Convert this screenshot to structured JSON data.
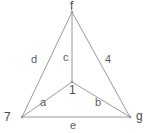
{
  "diagram": {
    "type": "graph",
    "background_color": "#ffffff",
    "edge_color": "#9a9a9a",
    "label_color": "#555555",
    "vertices": [
      {
        "id": "apex",
        "label": "f",
        "x": 72,
        "y": 12,
        "label_x": 70,
        "label_y": 0
      },
      {
        "id": "bottom-left",
        "label": "7",
        "x": 22,
        "y": 117,
        "label_x": 4,
        "label_y": 111
      },
      {
        "id": "bottom-right",
        "label": "g",
        "x": 130,
        "y": 117,
        "label_x": 136,
        "label_y": 110
      },
      {
        "id": "center",
        "label": "1",
        "x": 72,
        "y": 82,
        "label_x": 69,
        "label_y": 84
      }
    ],
    "edges": [
      {
        "id": "edge-d",
        "label": "d",
        "from": "bottom-left",
        "to": "apex",
        "label_x": 31,
        "label_y": 54
      },
      {
        "id": "edge-4",
        "label": "4",
        "from": "apex",
        "to": "bottom-right",
        "label_x": 105,
        "label_y": 54
      },
      {
        "id": "edge-e",
        "label": "e",
        "from": "bottom-left",
        "to": "bottom-right",
        "label_x": 70,
        "label_y": 120
      },
      {
        "id": "edge-c",
        "label": "c",
        "from": "apex",
        "to": "center",
        "label_x": 63,
        "label_y": 52
      },
      {
        "id": "edge-a",
        "label": "a",
        "from": "bottom-left",
        "to": "center",
        "label_x": 40,
        "label_y": 97
      },
      {
        "id": "edge-b",
        "label": "b",
        "from": "center",
        "to": "bottom-right",
        "label_x": 95,
        "label_y": 97
      }
    ]
  }
}
